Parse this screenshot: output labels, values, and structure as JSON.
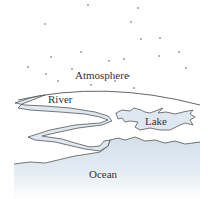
{
  "diagram": {
    "labels": {
      "atmosphere": "Atmosphere",
      "river": "River",
      "lake": "Lake",
      "ocean": "Ocean"
    },
    "colors": {
      "water_fill": "#dfe8f0",
      "ocean_top": "#d6e1ec",
      "ocean_bottom": "#ffffff",
      "outline": "#555555",
      "horizon": "#666666",
      "star": "#555555",
      "text": "#333333"
    },
    "stars": [
      [
        88,
        5
      ],
      [
        138,
        8
      ],
      [
        45,
        24
      ],
      [
        131,
        22
      ],
      [
        141,
        39
      ],
      [
        160,
        38
      ],
      [
        81,
        52
      ],
      [
        51,
        57
      ],
      [
        109,
        61
      ],
      [
        124,
        59
      ],
      [
        159,
        56
      ],
      [
        179,
        52
      ],
      [
        28,
        67
      ],
      [
        72,
        69
      ],
      [
        186,
        68
      ],
      [
        46,
        74
      ],
      [
        58,
        81
      ],
      [
        129,
        76
      ],
      [
        115,
        81
      ],
      [
        91,
        85
      ],
      [
        134,
        88
      ]
    ]
  }
}
